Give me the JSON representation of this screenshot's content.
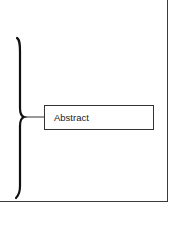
{
  "diagram": {
    "box": {
      "label": "Abstract"
    },
    "colors": {
      "stroke": "#222222",
      "frame": "#3a3a3a",
      "background": "#ffffff"
    }
  }
}
